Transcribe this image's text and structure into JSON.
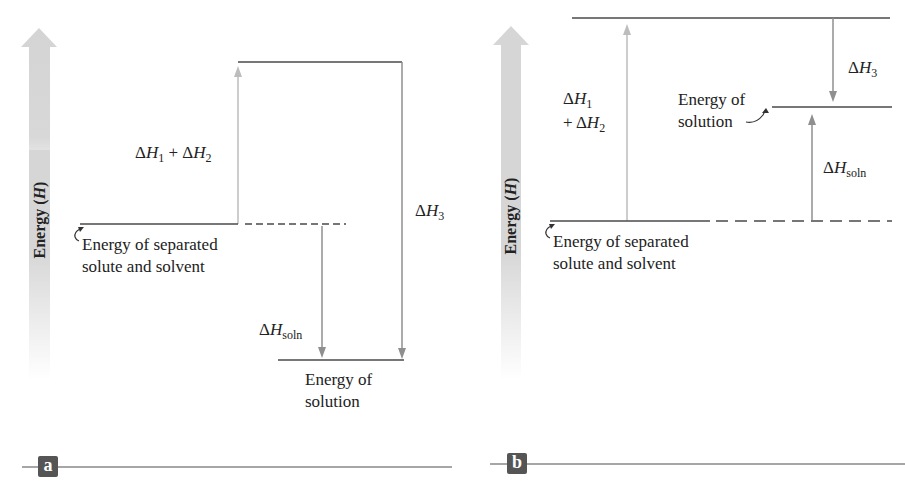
{
  "figure": {
    "colors": {
      "level_line": "#4a4a4a",
      "arrow_light": "#bdbdbd",
      "arrow_medium": "#8f8f8f",
      "energy_axis": "#d6d6d6",
      "badge_bg": "#555555",
      "rule": "#888888"
    }
  },
  "panel_a": {
    "badge": "a",
    "axis_label": "Energy",
    "axis_symbol": "H",
    "labels": {
      "dh12_delta1": "Δ",
      "dh12_h1": "H",
      "dh12_sub1": "1",
      "dh12_plus": " + Δ",
      "dh12_h2": "H",
      "dh12_sub2": "2",
      "dh3_delta": "Δ",
      "dh3_h": "H",
      "dh3_sub": "3",
      "dhsoln_delta": "Δ",
      "dhsoln_h": "H",
      "dhsoln_sub": "soln",
      "separated_line1": "Energy of separated",
      "separated_line2": "solute and solvent",
      "solution_line1": "Energy of",
      "solution_line2": "solution"
    }
  },
  "panel_b": {
    "badge": "b",
    "axis_label": "Energy",
    "axis_symbol": "H",
    "labels": {
      "dh1_delta": "Δ",
      "dh1_h": "H",
      "dh1_sub": "1",
      "dh2_plus": "+ Δ",
      "dh2_h": "H",
      "dh2_sub": "2",
      "dh3_delta": "Δ",
      "dh3_h": "H",
      "dh3_sub": "3",
      "dhsoln_delta": "Δ",
      "dhsoln_h": "H",
      "dhsoln_sub": "soln",
      "separated_line1": "Energy of separated",
      "separated_line2": "solute and solvent",
      "solution_line1": "Energy of",
      "solution_line2": "solution"
    }
  }
}
